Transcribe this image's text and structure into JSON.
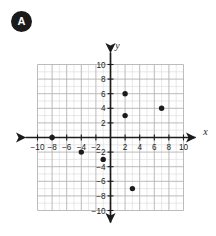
{
  "question_badge": {
    "label": "A",
    "shape": "filled-circle"
  },
  "chart_data": {
    "type": "scatter",
    "title": "",
    "xlabel": "x",
    "ylabel": "y",
    "xlim": [
      -10,
      10
    ],
    "ylim": [
      -10,
      10
    ],
    "grid": true,
    "minor_grid_step": 1,
    "major_grid_step": 2,
    "legend": "none",
    "x_tick_labels": [
      "-10",
      "-8",
      "-6",
      "-4",
      "-2",
      "2",
      "4",
      "6",
      "8",
      "10"
    ],
    "x_tick_values": [
      -10,
      -8,
      -6,
      -4,
      -2,
      2,
      4,
      6,
      8,
      10
    ],
    "y_tick_labels": [
      "10",
      "8",
      "6",
      "4",
      "2",
      "-2",
      "-4",
      "-6",
      "-8",
      "-10"
    ],
    "y_tick_values": [
      10,
      8,
      6,
      4,
      2,
      -2,
      -4,
      -6,
      -8,
      -10
    ],
    "point_color": "#1b1b1b",
    "grid_color": "#c9c9c9",
    "axis_color": "#1b1b1b",
    "points": [
      {
        "x": 2,
        "y": 6
      },
      {
        "x": 2,
        "y": 3
      },
      {
        "x": 7,
        "y": 4
      },
      {
        "x": -8,
        "y": 0
      },
      {
        "x": -4,
        "y": -2
      },
      {
        "x": -1,
        "y": -3
      },
      {
        "x": 3,
        "y": -7
      }
    ]
  }
}
